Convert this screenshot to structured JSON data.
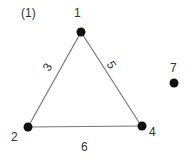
{
  "diagram": {
    "panel_label": "(1)",
    "nodes": [
      {
        "id": "1",
        "label": "1"
      },
      {
        "id": "2",
        "label": "2"
      },
      {
        "id": "4",
        "label": "4"
      },
      {
        "id": "7",
        "label": "7"
      }
    ],
    "edges": [
      {
        "from": "1",
        "to": "2",
        "label": "3"
      },
      {
        "from": "1",
        "to": "4",
        "label": "5"
      },
      {
        "from": "2",
        "to": "4",
        "label": "6"
      }
    ]
  }
}
